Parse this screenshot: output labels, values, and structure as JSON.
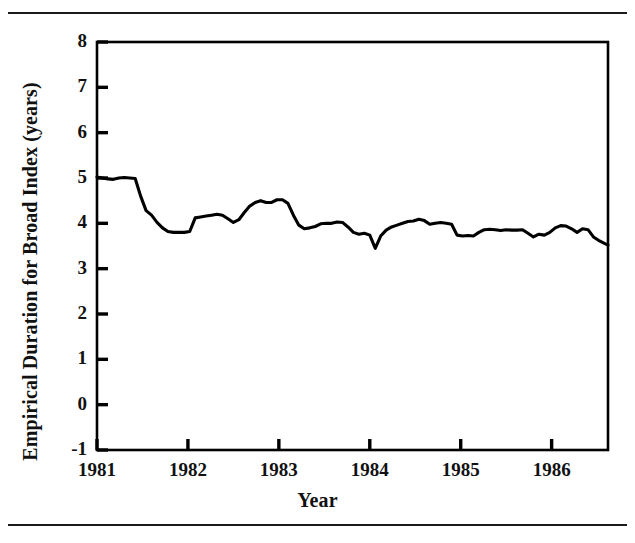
{
  "figure": {
    "top_rule": "horizontal-rule",
    "bottom_rule": "horizontal-rule"
  },
  "chart_data": {
    "type": "line",
    "title": "",
    "xlabel": "Year",
    "ylabel": "Empirical Duration for Broad Index (years)",
    "xlim": [
      1981.0,
      1986.62
    ],
    "ylim": [
      -1,
      8
    ],
    "grid": false,
    "legend": null,
    "xticks": [
      1981,
      1982,
      1983,
      1984,
      1985,
      1986
    ],
    "xtick_labels": [
      "1981",
      "1982",
      "1983",
      "1984",
      "1985",
      "1986"
    ],
    "yticks": [
      -1,
      0,
      1,
      2,
      3,
      4,
      5,
      6,
      7,
      8
    ],
    "ytick_labels": [
      "-1",
      "0",
      "1",
      "2",
      "3",
      "4",
      "5",
      "6",
      "7",
      "8"
    ],
    "series": [
      {
        "name": "Empirical Duration for Broad Index",
        "color": "#000000",
        "x": [
          1981.0,
          1981.06,
          1981.12,
          1981.18,
          1981.24,
          1981.3,
          1981.36,
          1981.42,
          1981.48,
          1981.54,
          1981.6,
          1981.66,
          1981.72,
          1981.78,
          1981.84,
          1981.9,
          1981.96,
          1982.02,
          1982.08,
          1982.14,
          1982.2,
          1982.26,
          1982.32,
          1982.38,
          1982.44,
          1982.5,
          1982.56,
          1982.62,
          1982.68,
          1982.74,
          1982.8,
          1982.86,
          1982.92,
          1982.98,
          1983.04,
          1983.1,
          1983.16,
          1983.22,
          1983.28,
          1983.34,
          1983.4,
          1983.46,
          1983.52,
          1983.58,
          1983.64,
          1983.7,
          1983.76,
          1983.82,
          1983.88,
          1983.94,
          1984.0,
          1984.06,
          1984.12,
          1984.18,
          1984.24,
          1984.3,
          1984.36,
          1984.42,
          1984.48,
          1984.54,
          1984.6,
          1984.66,
          1984.72,
          1984.78,
          1984.84,
          1984.9,
          1984.96,
          1985.02,
          1985.08,
          1985.14,
          1985.2,
          1985.26,
          1985.32,
          1985.38,
          1985.44,
          1985.5,
          1985.56,
          1985.62,
          1985.68,
          1985.74,
          1985.8,
          1985.86,
          1985.92,
          1985.98,
          1986.04,
          1986.1,
          1986.16,
          1986.22,
          1986.28,
          1986.34,
          1986.4,
          1986.46,
          1986.52,
          1986.62
        ],
        "y": [
          5.02,
          5.0,
          4.98,
          4.97,
          5.0,
          5.01,
          5.0,
          4.99,
          4.6,
          4.28,
          4.18,
          4.02,
          3.9,
          3.82,
          3.8,
          3.8,
          3.8,
          3.82,
          4.12,
          4.14,
          4.16,
          4.18,
          4.2,
          4.18,
          4.1,
          4.02,
          4.08,
          4.24,
          4.38,
          4.46,
          4.5,
          4.46,
          4.46,
          4.52,
          4.52,
          4.44,
          4.18,
          3.96,
          3.88,
          3.9,
          3.93,
          3.99,
          4.0,
          4.0,
          4.03,
          4.02,
          3.92,
          3.8,
          3.76,
          3.78,
          3.74,
          3.45,
          3.72,
          3.85,
          3.92,
          3.96,
          4.0,
          4.04,
          4.05,
          4.09,
          4.06,
          3.98,
          4.0,
          4.02,
          4.0,
          3.98,
          3.74,
          3.72,
          3.73,
          3.72,
          3.8,
          3.86,
          3.87,
          3.86,
          3.84,
          3.86,
          3.85,
          3.85,
          3.86,
          3.78,
          3.7,
          3.76,
          3.74,
          3.8,
          3.9,
          3.95,
          3.94,
          3.88,
          3.8,
          3.88,
          3.86,
          3.7,
          3.62,
          3.52
        ]
      }
    ]
  }
}
